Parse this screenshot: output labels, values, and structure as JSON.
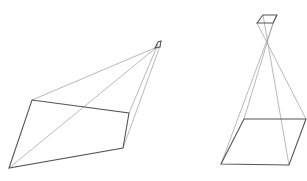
{
  "figures": [
    {
      "name": "left-frustum",
      "apex_quad": [
        [
          155,
          48
        ],
        [
          158,
          42
        ],
        [
          161,
          41
        ],
        [
          160,
          47
        ]
      ],
      "base_quad": [
        [
          32,
          100
        ],
        [
          129,
          113
        ],
        [
          123,
          148
        ],
        [
          9,
          168
        ]
      ],
      "rays": [
        [
          [
            32,
            100
          ],
          [
            157,
            47
          ]
        ],
        [
          [
            9,
            168
          ],
          [
            157,
            47
          ]
        ],
        [
          [
            129,
            113
          ],
          [
            158,
            44
          ]
        ],
        [
          [
            123,
            148
          ],
          [
            160,
            46
          ]
        ]
      ],
      "colors": {
        "thick": "#555555",
        "thin": "#9a9a9a"
      }
    },
    {
      "name": "right-frustum",
      "apex_quad": [
        [
          257,
          23
        ],
        [
          263,
          15
        ],
        [
          277,
          15
        ],
        [
          273,
          23
        ]
      ],
      "base_quad": [
        [
          244,
          119
        ],
        [
          306,
          119
        ],
        [
          289,
          165
        ],
        [
          221,
          164
        ]
      ],
      "rays": [
        [
          [
            244,
            119
          ],
          [
            273,
            23
          ]
        ],
        [
          [
            221,
            164
          ],
          [
            276,
            16
          ]
        ],
        [
          [
            306,
            119
          ],
          [
            257,
            23
          ]
        ],
        [
          [
            289,
            165
          ],
          [
            263,
            15
          ]
        ]
      ],
      "colors": {
        "thick": "#555555",
        "thin": "#9a9a9a"
      }
    }
  ]
}
